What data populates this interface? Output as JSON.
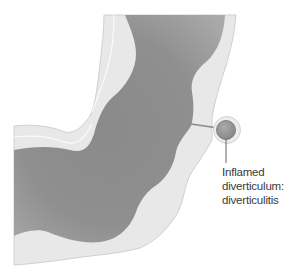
{
  "figure": {
    "annotation": {
      "lines": [
        "Inflamed",
        "diverticulum:",
        "diverticulitis"
      ]
    },
    "colors": {
      "background": "#ffffff",
      "wall": "#e8e8e8",
      "wall_edge": "#cfcfcf",
      "lumen_dark": "#7e7e7e",
      "lumen_light": "#a8a8a8",
      "leader_line": "#555555"
    }
  }
}
